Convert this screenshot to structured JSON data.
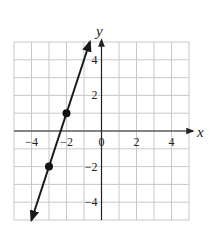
{
  "chart_data": {
    "type": "line",
    "title": "",
    "xlabel": "x",
    "ylabel": "y",
    "xlim": [
      -5,
      5
    ],
    "ylim": [
      -5,
      5
    ],
    "grid": true,
    "x_ticks": [
      -4,
      -2,
      0,
      2,
      4
    ],
    "y_ticks": [
      4,
      2,
      -2,
      -4
    ],
    "x_tick_labels": [
      "−4",
      "−2",
      "0",
      "2",
      "4"
    ],
    "y_tick_labels": [
      "4",
      "2",
      "−2",
      "−4"
    ],
    "series": [
      {
        "name": "y = 3x + 7",
        "equation": "y = 3x + 7",
        "slope": 3,
        "intercept": 7,
        "line_start": {
          "x": -4,
          "y": -5
        },
        "line_end": {
          "x": -0.667,
          "y": 5
        },
        "arrows": "both",
        "points": [
          {
            "x": -2,
            "y": 1
          },
          {
            "x": -3,
            "y": -2
          }
        ]
      }
    ],
    "legend": "none"
  },
  "colors": {
    "grid": "#c8c8c8",
    "axis": "#222222",
    "line": "#1a1a1a",
    "point": "#111111"
  }
}
